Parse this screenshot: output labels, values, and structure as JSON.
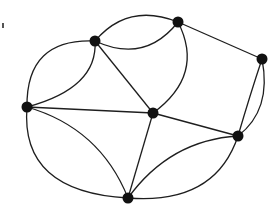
{
  "diagram": {
    "type": "planar-multigraph",
    "width": 280,
    "height": 213,
    "colors": {
      "edge": "#1e1e1e",
      "node": "#111111",
      "background": "#ffffff"
    },
    "nodes": [
      {
        "id": "A",
        "x": 95,
        "y": 41
      },
      {
        "id": "B",
        "x": 178,
        "y": 22
      },
      {
        "id": "C",
        "x": 262,
        "y": 59
      },
      {
        "id": "D",
        "x": 27,
        "y": 107
      },
      {
        "id": "E",
        "x": 153,
        "y": 113
      },
      {
        "id": "F",
        "x": 238,
        "y": 136
      },
      {
        "id": "G",
        "x": 128,
        "y": 198
      }
    ],
    "edges": [
      {
        "from": "A",
        "to": "B",
        "shape": "arc-upper"
      },
      {
        "from": "A",
        "to": "B",
        "shape": "arc-lower"
      },
      {
        "from": "A",
        "to": "D",
        "shape": "arc-outer"
      },
      {
        "from": "A",
        "to": "D",
        "shape": "arc-inner"
      },
      {
        "from": "A",
        "to": "E",
        "shape": "straight"
      },
      {
        "from": "B",
        "to": "C",
        "shape": "straight"
      },
      {
        "from": "B",
        "to": "E",
        "shape": "arc"
      },
      {
        "from": "C",
        "to": "F",
        "shape": "arc-outer"
      },
      {
        "from": "C",
        "to": "F",
        "shape": "arc-inner"
      },
      {
        "from": "D",
        "to": "E",
        "shape": "straight"
      },
      {
        "from": "D",
        "to": "G",
        "shape": "arc-outer"
      },
      {
        "from": "D",
        "to": "G",
        "shape": "arc-inner"
      },
      {
        "from": "E",
        "to": "F",
        "shape": "straight"
      },
      {
        "from": "E",
        "to": "G",
        "shape": "straight"
      },
      {
        "from": "F",
        "to": "G",
        "shape": "arc-outer"
      },
      {
        "from": "F",
        "to": "G",
        "shape": "arc-inner"
      }
    ],
    "marks": [
      {
        "id": "corner-mark",
        "x": 3,
        "y": 25
      }
    ]
  }
}
